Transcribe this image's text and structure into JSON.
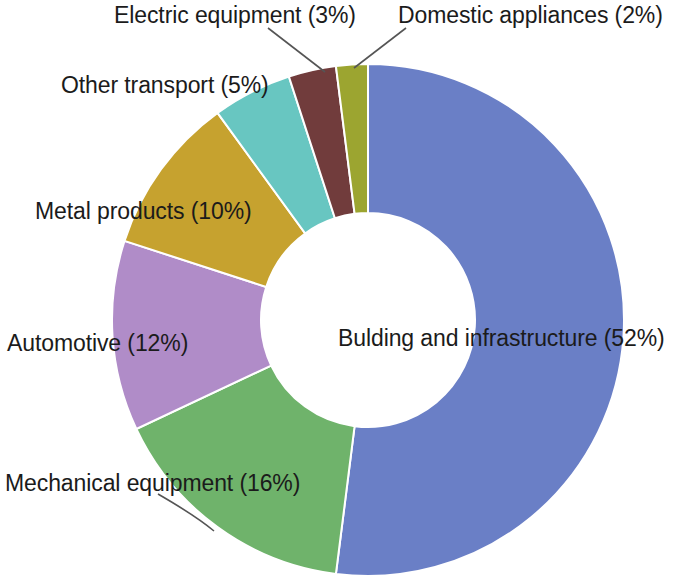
{
  "chart_data": {
    "type": "pie",
    "variant": "donut",
    "title": "",
    "subtitle": "",
    "xlabel": "",
    "ylabel": "",
    "units": "percent",
    "legend": "none",
    "grid": false,
    "labels_inline": true,
    "start_angle_deg": 0,
    "direction": "clockwise",
    "categories": [
      "Bulding and infrastructure",
      "Mechanical equipment",
      "Automotive",
      "Metal products",
      "Other transport",
      "Electric equipment",
      "Domestic appliances"
    ],
    "values": [
      52,
      16,
      12,
      10,
      5,
      3,
      2
    ],
    "colors": [
      "#6a7fc6",
      "#6fb36b",
      "#b08cc8",
      "#c6a22f",
      "#68c6c1",
      "#713c3c",
      "#9ca530"
    ],
    "slices": [
      {
        "label": "Bulding and infrastructure",
        "value": 52,
        "value_text": "52%",
        "display_text": "Bulding and infrastructure (52%)",
        "color": "#6a7fc6",
        "leader_line": false
      },
      {
        "label": "Mechanical equipment",
        "value": 16,
        "value_text": "16%",
        "display_text": "Mechanical equipment (16%)",
        "color": "#6fb36b",
        "leader_line": true
      },
      {
        "label": "Automotive",
        "value": 12,
        "value_text": "12%",
        "display_text": "Automotive (12%)",
        "color": "#b08cc8",
        "leader_line": false
      },
      {
        "label": "Metal products",
        "value": 10,
        "value_text": "10%",
        "display_text": "Metal products (10%)",
        "color": "#c6a22f",
        "leader_line": false
      },
      {
        "label": "Other transport",
        "value": 5,
        "value_text": "5%",
        "display_text": "Other transport (5%)",
        "color": "#68c6c1",
        "leader_line": false
      },
      {
        "label": "Electric equipment",
        "value": 3,
        "value_text": "3%",
        "display_text": "Electric equipment (3%)",
        "color": "#713c3c",
        "leader_line": true
      },
      {
        "label": "Domestic appliances",
        "value": 2,
        "value_text": "2%",
        "display_text": "Domestic appliances (2%)",
        "color": "#9ca530",
        "leader_line": true
      }
    ]
  },
  "labels": {
    "building": "Bulding and infrastructure (52%)",
    "mechanical": "Mechanical equipment (16%)",
    "automotive": "Automotive (12%)",
    "metal": "Metal products (10%)",
    "other_transport": "Other transport (5%)",
    "electric": "Electric equipment (3%)",
    "domestic": "Domestic appliances (2%)"
  },
  "geometry": {
    "center_x": 368,
    "center_y": 320,
    "outer_radius": 256,
    "inner_radius": 107
  }
}
